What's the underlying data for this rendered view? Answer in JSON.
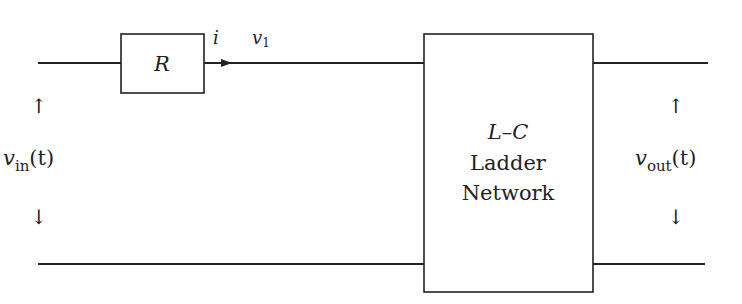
{
  "diagram": {
    "resistor": {
      "label": "R"
    },
    "current": {
      "label": "i"
    },
    "node_voltage": {
      "var": "v",
      "sub": "1"
    },
    "input": {
      "var": "v",
      "sub": "in",
      "arg": "(t)",
      "up_arrow": "↑",
      "down_arrow": "↓"
    },
    "output": {
      "var": "v",
      "sub": "out",
      "arg": "(t)",
      "up_arrow": "↑",
      "down_arrow": "↓"
    },
    "network": {
      "line1": "L–C",
      "line2": "Ladder",
      "line3": "Network"
    },
    "colors": {
      "stroke": "#222222",
      "background": "#ffffff"
    }
  }
}
